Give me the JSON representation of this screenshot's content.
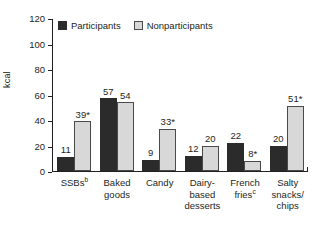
{
  "chart_data": {
    "type": "bar",
    "title": "",
    "xlabel": "",
    "ylabel": "kcal",
    "ylim": [
      0,
      120
    ],
    "yticks": [
      0,
      20,
      40,
      60,
      80,
      100,
      120
    ],
    "grid": false,
    "legend_position": "top-left-inside",
    "categories": [
      "SSBs",
      "Baked goods",
      "Candy",
      "Dairy-based desserts",
      "French fries",
      "Salty snacks/chips"
    ],
    "category_footnotes": [
      "b",
      "",
      "",
      "",
      "c",
      ""
    ],
    "category_lines": [
      [
        "SSBs"
      ],
      [
        "Baked",
        "goods"
      ],
      [
        "Candy"
      ],
      [
        "Dairy-",
        "based",
        "desserts"
      ],
      [
        "French",
        "fries"
      ],
      [
        "Salty",
        "snacks/",
        "chips"
      ]
    ],
    "series": [
      {
        "name": "Participants",
        "color": "#2b2b2b",
        "values": [
          11,
          57,
          9,
          12,
          22,
          20
        ],
        "labels": [
          "11",
          "57",
          "9",
          "12",
          "22",
          "20"
        ]
      },
      {
        "name": "Nonparticipants",
        "color": "#d8d8d8",
        "values": [
          39,
          54,
          33,
          20,
          8,
          51
        ],
        "labels": [
          "39*",
          "54",
          "33*",
          "20",
          "8*",
          "51*"
        ]
      }
    ]
  },
  "legend": {
    "items": [
      {
        "label": "Participants"
      },
      {
        "label": "Nonparticipants"
      }
    ]
  },
  "axis": {
    "y_label": "kcal",
    "y_tick_labels": [
      "120",
      "100",
      "80",
      "60",
      "40",
      "20",
      "0"
    ]
  }
}
